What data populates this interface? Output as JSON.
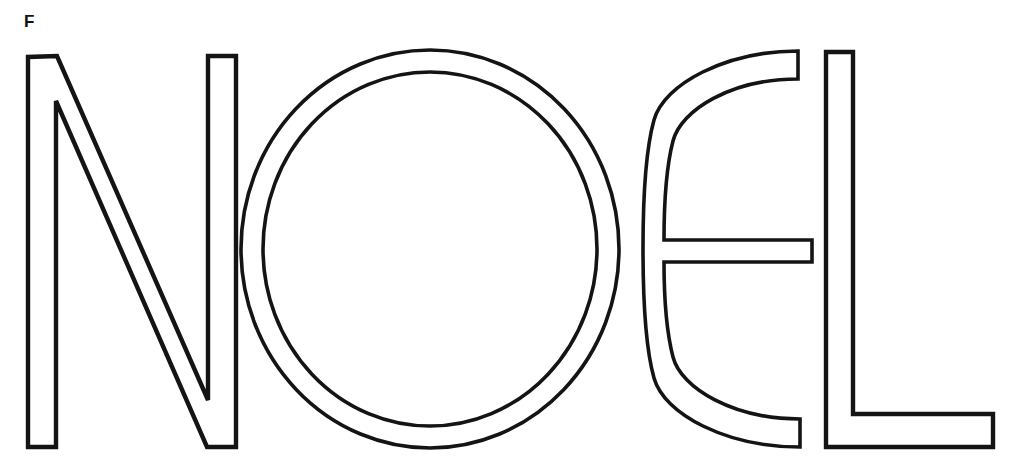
{
  "page": {
    "corner_label": "F",
    "word": "NOEL",
    "background_color": "#ffffff",
    "stroke_color": "#141414",
    "canvas_width": 1010,
    "canvas_height": 458
  },
  "artwork": {
    "title": "NOEL outline lettering",
    "style": "coloring-page outline, unfilled letterforms",
    "baseline_y": 448,
    "cap_top_y": 50,
    "letters": [
      {
        "name": "letter-N",
        "character": "N",
        "left_x": 28,
        "right_x": 236,
        "stem_width": 27,
        "description": "outline N, vertical left stem, diagonal, vertical right stem"
      },
      {
        "name": "letter-O",
        "character": "O",
        "left_x": 240,
        "right_x": 619,
        "center_x": 430,
        "center_y": 249,
        "outer_rx": 189,
        "outer_ry": 199,
        "ring_thickness": 22,
        "description": "outline O drawn as concentric circles forming a ring"
      },
      {
        "name": "letter-E",
        "character": "E",
        "left_x": 643,
        "right_x": 812,
        "bar_top_y": 240,
        "bar_bottom_y": 262,
        "description": "rounded E, open-right arc with horizontal middle bar"
      },
      {
        "name": "letter-L",
        "character": "L",
        "left_x": 826,
        "right_x": 993,
        "stem_width": 27,
        "foot_top_y": 414,
        "description": "outline L, vertical stem with horizontal foot to the right"
      }
    ]
  }
}
